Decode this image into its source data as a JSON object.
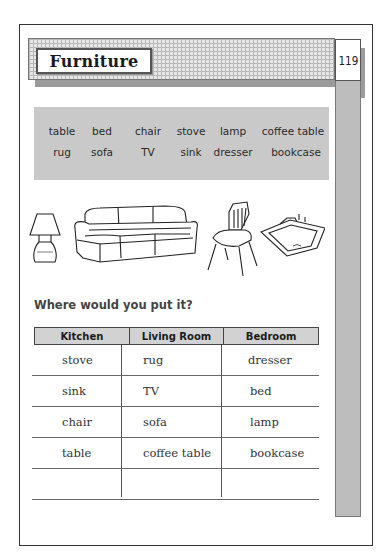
{
  "header": {
    "title": "Furniture",
    "page_number": "119"
  },
  "word_bank": {
    "row1": [
      "table",
      "bed",
      "chair",
      "stove",
      "lamp",
      "coffee table"
    ],
    "row2": [
      "rug",
      "sofa",
      "TV",
      "sink",
      "dresser",
      "bookcase"
    ]
  },
  "illustrations": [
    "lamp-icon",
    "sofa-icon",
    "chair-icon",
    "sink-icon"
  ],
  "question": "Where would you put it?",
  "table": {
    "headers": [
      "Kitchen",
      "Living Room",
      "Bedroom"
    ],
    "rows": [
      [
        "stove",
        "rug",
        "dresser"
      ],
      [
        "sink",
        "TV",
        "bed"
      ],
      [
        "chair",
        "sofa",
        "lamp"
      ],
      [
        "table",
        "coffee table",
        "bookcase"
      ],
      [
        "",
        "",
        ""
      ]
    ]
  },
  "colors": {
    "word_bank_bg": "#c9c9c9",
    "header_band_bg": "#e6e6e6",
    "side_strip": "#bdbdbd",
    "table_header_bg": "#d2d2d2"
  }
}
